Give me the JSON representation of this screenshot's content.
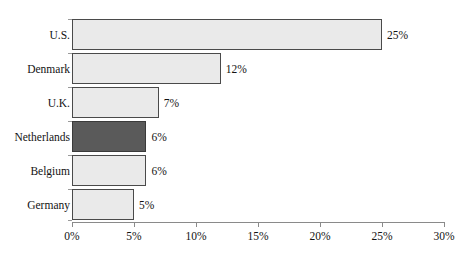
{
  "chart_data": {
    "type": "bar",
    "orientation": "horizontal",
    "title": "",
    "xlabel": "",
    "ylabel": "",
    "categories": [
      "U.S.",
      "Denmark",
      "U.K.",
      "Netherlands",
      "Belgium",
      "Germany"
    ],
    "values": [
      25,
      12,
      7,
      6,
      6,
      5
    ],
    "value_labels": [
      "25%",
      "12%",
      "7%",
      "6%",
      "6%",
      "5%"
    ],
    "xlim": [
      0,
      30
    ],
    "xticks": [
      0,
      5,
      10,
      15,
      20,
      25,
      30
    ],
    "xtick_labels": [
      "0%",
      "5%",
      "10%",
      "15%",
      "20%",
      "25%",
      "30%"
    ],
    "grid": false,
    "legend": "none",
    "highlighted_category": "Netherlands",
    "colors": {
      "bar_fill": "#eaeaea",
      "bar_border": "#4a4a4a",
      "highlight_fill": "#5a5a5a",
      "highlight_border": "#3a3a3a",
      "axis": "#8a8a8a",
      "background": "#ffffff",
      "text": "#131313"
    }
  },
  "clipped_header": {
    "text": "······························"
  }
}
